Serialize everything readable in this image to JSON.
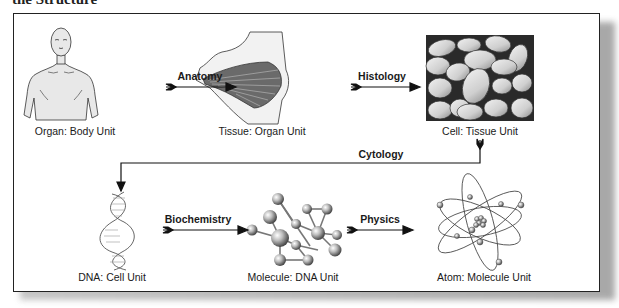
{
  "title": "the Structure",
  "diagram": {
    "nodes": [
      {
        "id": "organ",
        "label": "Organ: Body Unit",
        "icon": "human-torso-icon"
      },
      {
        "id": "tissue",
        "label": "Tissue: Organ Unit",
        "icon": "pectoral-muscle-icon"
      },
      {
        "id": "cell",
        "label": "Cell: Tissue Unit",
        "icon": "cells-icon"
      },
      {
        "id": "dna",
        "label": "DNA: Cell Unit",
        "icon": "dna-helix-icon"
      },
      {
        "id": "molecule",
        "label": "Molecule: DNA Unit",
        "icon": "molecule-icon"
      },
      {
        "id": "atom",
        "label": "Atom: Molecule Unit",
        "icon": "atom-icon"
      }
    ],
    "edges": [
      {
        "from": "organ",
        "to": "tissue",
        "label": "Anatomy"
      },
      {
        "from": "tissue",
        "to": "cell",
        "label": "Histology"
      },
      {
        "from": "cell",
        "to": "dna",
        "label": "Cytology"
      },
      {
        "from": "dna",
        "to": "molecule",
        "label": "Biochemistry"
      },
      {
        "from": "molecule",
        "to": "atom",
        "label": "Physics"
      }
    ]
  },
  "colors": {
    "line": "#111111",
    "frame_border": "#222222",
    "cell_background": "#2a2a2a",
    "cell_fill": "#d9d9d9",
    "skin": "#e6e6e6"
  }
}
